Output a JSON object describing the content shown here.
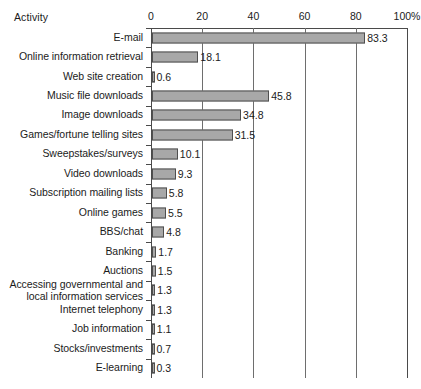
{
  "header": {
    "category_column_title": "Activity"
  },
  "chart_data": {
    "type": "bar",
    "orientation": "horizontal",
    "title": "",
    "xlabel": "",
    "ylabel": "Activity",
    "xlim": [
      0,
      100
    ],
    "xticks": [
      0,
      20,
      40,
      60,
      80,
      100
    ],
    "xtick_labels": [
      "0",
      "20",
      "40",
      "60",
      "80",
      "100%"
    ],
    "grid": true,
    "legend": false,
    "bar_color": "#a8a8a8",
    "bar_border_color": "#4f4f4f",
    "axis_color": "#4a4a4a",
    "categories": [
      "E-mail",
      "Online information retrieval",
      "Web site creation",
      "Music file downloads",
      "Image downloads",
      "Games/fortune telling sites",
      "Sweepstakes/surveys",
      "Video downloads",
      "Subscription mailing lists",
      "Online games",
      "BBS/chat",
      "Banking",
      "Auctions",
      "Accessing governmental and\nlocal information services",
      "Internet telephony",
      "Job information",
      "Stocks/investments",
      "E-learning"
    ],
    "values": [
      83.3,
      18.1,
      0.6,
      45.8,
      34.8,
      31.5,
      10.1,
      9.3,
      5.8,
      5.5,
      4.8,
      1.7,
      1.5,
      1.3,
      1.3,
      1.1,
      0.7,
      0.3
    ],
    "value_labels": [
      "83.3",
      "18.1",
      "0.6",
      "45.8",
      "34.8",
      "31.5",
      "10.1",
      "9.3",
      "5.8",
      "5.5",
      "4.8",
      "1.7",
      "1.5",
      "1.3",
      "1.3",
      "1.1",
      "0.7",
      "0.3"
    ]
  }
}
